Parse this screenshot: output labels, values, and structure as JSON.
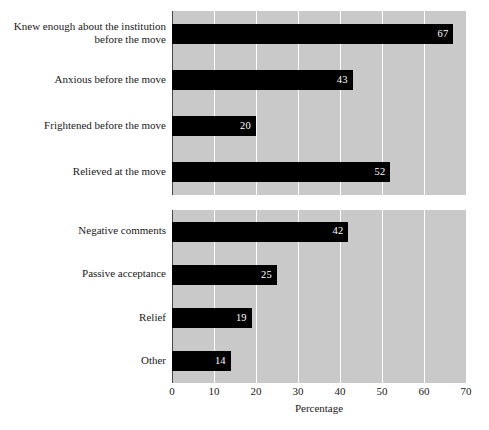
{
  "chart_data": [
    {
      "type": "bar",
      "orientation": "horizontal",
      "panel": "top",
      "title": "",
      "xlabel": "Percentage",
      "ylabel": "",
      "xlim": [
        0,
        70
      ],
      "xticks": [
        0,
        10,
        20,
        30,
        40,
        50,
        60,
        70
      ],
      "grid": true,
      "legend": "none",
      "categories": [
        "Knew enough about the institution before the move",
        "Anxious before the move",
        "Frightened before the move",
        "Relieved at the move"
      ],
      "category_lines": [
        [
          "Knew enough about the institution",
          "before the move"
        ],
        [
          "Anxious before the move"
        ],
        [
          "Frightened before the move"
        ],
        [
          "Relieved at the move"
        ]
      ],
      "values": [
        67,
        43,
        20,
        52
      ],
      "value_labels": [
        "67",
        "43",
        "20",
        "52"
      ]
    },
    {
      "type": "bar",
      "orientation": "horizontal",
      "panel": "bottom",
      "title": "",
      "xlabel": "Percentage",
      "ylabel": "",
      "xlim": [
        0,
        70
      ],
      "xticks": [
        0,
        10,
        20,
        30,
        40,
        50,
        60,
        70
      ],
      "grid": true,
      "legend": "none",
      "categories": [
        "Negative comments",
        "Passive acceptance",
        "Relief",
        "Other"
      ],
      "category_lines": [
        [
          "Negative comments"
        ],
        [
          "Passive acceptance"
        ],
        [
          "Relief"
        ],
        [
          "Other"
        ]
      ],
      "values": [
        42,
        25,
        19,
        14
      ],
      "value_labels": [
        "42",
        "25",
        "19",
        "14"
      ]
    }
  ],
  "axis": {
    "title": "Percentage",
    "tick_labels": [
      "0",
      "10",
      "20",
      "30",
      "40",
      "50",
      "60",
      "70"
    ]
  },
  "colors": {
    "bar": "#000000",
    "plot_background": "#c9c9c9",
    "gridline": "#ffffff",
    "value_label": "#ffffff",
    "text": "#1a1a1a",
    "page_background": "#ffffff"
  }
}
